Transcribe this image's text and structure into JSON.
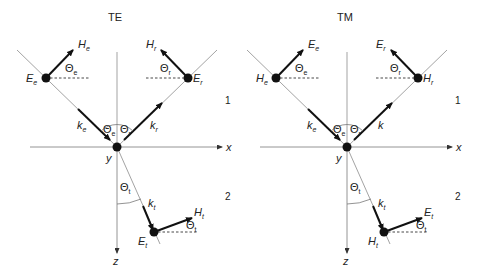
{
  "panels": [
    {
      "title": "TE",
      "incident_point_label": "E",
      "incident_point_sub": "e",
      "incident_vec_label": "H",
      "incident_vec_sub": "e",
      "incident_angle_label": "Θ",
      "incident_angle_sub": "e",
      "reflected_point_label": "E",
      "reflected_point_sub": "r",
      "reflected_vec_label": "H",
      "reflected_vec_sub": "r",
      "reflected_angle_label": "Θ",
      "reflected_angle_sub": "r",
      "k_incident": "k",
      "k_incident_sub": "e",
      "k_reflected": "k",
      "k_reflected_sub": "r",
      "theta_e": "Θ",
      "theta_e_sub": "e",
      "theta_r": "Θ",
      "theta_r_sub": "r",
      "theta_t": "Θ",
      "theta_t_sub": "t",
      "k_transmitted": "k",
      "k_transmitted_sub": "t",
      "transmitted_point_label": "E",
      "transmitted_point_sub": "t",
      "transmitted_vec_label": "H",
      "transmitted_vec_sub": "t",
      "transmitted_angle_label": "Θ",
      "transmitted_angle_sub": "t",
      "axis_x": "x",
      "axis_y": "y",
      "axis_z": "z",
      "medium_1": "1",
      "medium_2": "2"
    },
    {
      "title": "TM",
      "incident_point_label": "H",
      "incident_point_sub": "e",
      "incident_vec_label": "E",
      "incident_vec_sub": "e",
      "incident_angle_label": "Θ",
      "incident_angle_sub": "e",
      "reflected_point_label": "H",
      "reflected_point_sub": "r",
      "reflected_vec_label": "E",
      "reflected_vec_sub": "r",
      "reflected_angle_label": "Θ",
      "reflected_angle_sub": "r",
      "k_incident": "k",
      "k_incident_sub": "e",
      "k_reflected": "k",
      "k_reflected_sub": "",
      "theta_e": "Θ",
      "theta_e_sub": "e",
      "theta_r": "Θ",
      "theta_r_sub": "r",
      "theta_t": "Θ",
      "theta_t_sub": "t",
      "k_transmitted": "k",
      "k_transmitted_sub": "t",
      "transmitted_point_label": "H",
      "transmitted_point_sub": "t",
      "transmitted_vec_label": "E",
      "transmitted_vec_sub": "t",
      "transmitted_angle_label": "Θ",
      "transmitted_angle_sub": "t",
      "axis_x": "x",
      "axis_y": "y",
      "axis_z": "z",
      "medium_1": "1",
      "medium_2": "2"
    }
  ]
}
